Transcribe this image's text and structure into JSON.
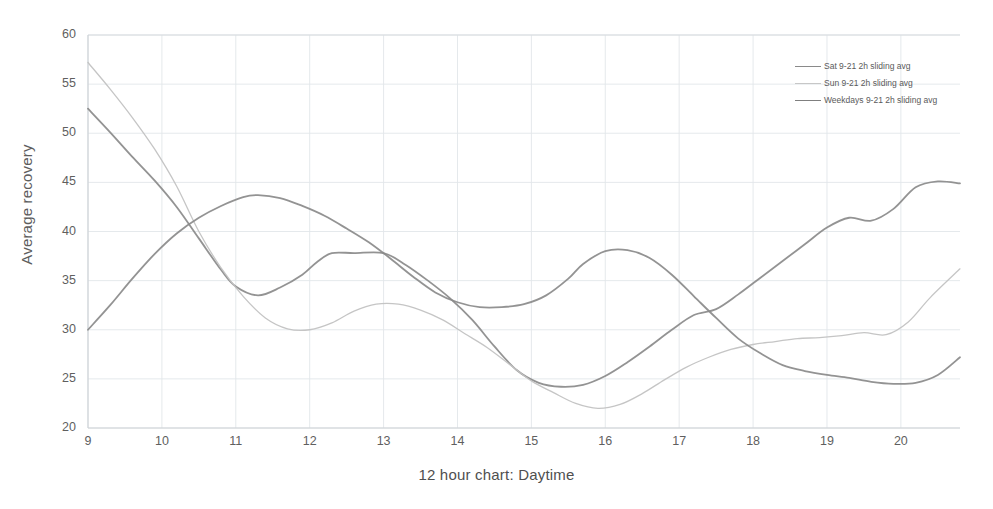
{
  "chart_data": {
    "type": "line",
    "title": "",
    "xlabel": "12 hour chart: Daytime",
    "ylabel": "Average recovery",
    "xlim": [
      9,
      20.8
    ],
    "ylim": [
      20,
      60
    ],
    "yticks": [
      20,
      25,
      30,
      35,
      40,
      45,
      50,
      55,
      60
    ],
    "xticks": [
      9,
      10,
      11,
      12,
      13,
      14,
      15,
      16,
      17,
      18,
      19,
      20
    ],
    "grid": true,
    "legend_position": "top-right",
    "series": [
      {
        "name": "Sat  9-21 2h sliding avg",
        "color": "#8a8a8a",
        "x": [
          9.0,
          9.3,
          9.6,
          9.9,
          10.2,
          10.5,
          10.8,
          11.0,
          11.3,
          11.6,
          11.9,
          12.1,
          12.3,
          12.6,
          13.0,
          13.3,
          13.6,
          13.9,
          14.2,
          14.5,
          14.8,
          15.1,
          15.4,
          15.7,
          16.0,
          16.3,
          16.6,
          16.9,
          17.2,
          17.5,
          17.8,
          18.1,
          18.4,
          18.7,
          19.0,
          19.3,
          19.6,
          19.9,
          20.2,
          20.5,
          20.8
        ],
        "y": [
          52.5,
          50.1,
          47.6,
          45.2,
          42.5,
          39.3,
          36.1,
          34.4,
          33.5,
          34.3,
          35.6,
          36.9,
          37.8,
          37.8,
          37.8,
          36.6,
          35.0,
          33.2,
          31.0,
          28.3,
          25.9,
          24.6,
          24.2,
          24.4,
          25.3,
          26.7,
          28.3,
          30.0,
          31.5,
          32.1,
          33.6,
          35.3,
          37.0,
          38.7,
          40.4,
          41.4,
          41.1,
          42.3,
          44.5,
          45.1,
          44.9
        ]
      },
      {
        "name": "Sun  9-21 2h sliding avg",
        "color": "#c2c2c2",
        "x": [
          9.0,
          9.3,
          9.6,
          9.9,
          10.2,
          10.5,
          10.8,
          11.1,
          11.4,
          11.7,
          12.0,
          12.3,
          12.6,
          12.9,
          13.2,
          13.5,
          13.8,
          14.1,
          14.4,
          14.7,
          15.0,
          15.3,
          15.6,
          15.9,
          16.2,
          16.5,
          16.8,
          17.1,
          17.4,
          17.7,
          18.0,
          18.3,
          18.6,
          18.9,
          19.2,
          19.5,
          19.8,
          20.1,
          20.4,
          20.8
        ],
        "y": [
          57.2,
          54.5,
          51.6,
          48.4,
          44.6,
          40.0,
          36.3,
          33.4,
          31.2,
          30.1,
          30.0,
          30.7,
          31.9,
          32.6,
          32.6,
          32.0,
          31.0,
          29.6,
          28.2,
          26.5,
          24.8,
          23.6,
          22.5,
          22.0,
          22.4,
          23.5,
          24.9,
          26.2,
          27.2,
          28.0,
          28.5,
          28.8,
          29.1,
          29.2,
          29.4,
          29.7,
          29.5,
          30.8,
          33.3,
          36.2
        ]
      },
      {
        "name": "Weekdays 9-21 2h sliding avg",
        "color": "#8a8a8a",
        "x": [
          9.0,
          9.3,
          9.6,
          9.9,
          10.2,
          10.5,
          10.8,
          11.1,
          11.3,
          11.6,
          11.9,
          12.2,
          12.5,
          12.8,
          13.1,
          13.4,
          13.7,
          14.0,
          14.3,
          14.6,
          14.9,
          15.2,
          15.5,
          15.7,
          16.0,
          16.3,
          16.6,
          16.9,
          17.2,
          17.5,
          17.8,
          18.1,
          18.4,
          18.7,
          19.0,
          19.3,
          19.6,
          19.9,
          20.2,
          20.5,
          20.8
        ],
        "y": [
          30.0,
          32.5,
          35.2,
          37.7,
          39.8,
          41.4,
          42.6,
          43.5,
          43.7,
          43.4,
          42.6,
          41.6,
          40.3,
          38.9,
          37.2,
          35.4,
          33.8,
          32.8,
          32.3,
          32.3,
          32.6,
          33.5,
          35.2,
          36.7,
          38.0,
          38.1,
          37.3,
          35.6,
          33.4,
          31.2,
          29.1,
          27.6,
          26.4,
          25.8,
          25.4,
          25.1,
          24.7,
          24.5,
          24.6,
          25.4,
          27.2
        ]
      }
    ],
    "extra_points": {
      "weekdays_tail_x": [
        20.2,
        20.5,
        20.8
      ],
      "weekdays_tail_y": [
        26.0,
        28.8,
        31.9
      ],
      "sun_tail_x": [
        20.4,
        20.8
      ],
      "sun_tail_y": [
        36.2,
        39.2
      ]
    }
  },
  "legend": {
    "items": [
      {
        "label": "Sat  9-21 2h sliding avg",
        "color": "#8a8a8a"
      },
      {
        "label": "Sun  9-21 2h sliding avg",
        "color": "#c7c7c7"
      },
      {
        "label": "Weekdays 9-21 2h sliding avg",
        "color": "#7f7f7f"
      }
    ]
  },
  "axes": {
    "y_title": "Average recovery",
    "x_title": "12 hour chart: Daytime",
    "y_ticks": [
      "60",
      "55",
      "50",
      "45",
      "40",
      "35",
      "30",
      "25",
      "20"
    ],
    "x_ticks": [
      "9",
      "10",
      "11",
      "12",
      "13",
      "14",
      "15",
      "16",
      "17",
      "18",
      "19",
      "20"
    ]
  },
  "colors": {
    "background": "#ffffff",
    "grid": "#e2e6ea",
    "axis": "#d0d4d8",
    "text": "#5f5f5f"
  }
}
